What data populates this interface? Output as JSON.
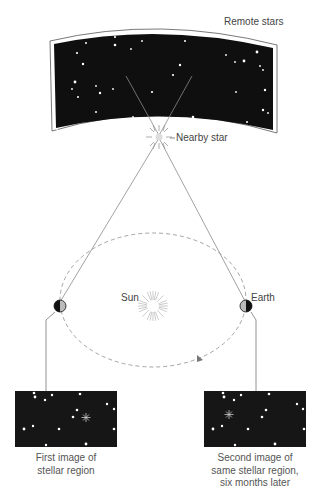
{
  "labels": {
    "remote_stars": "Remote stars",
    "nearby_star": "Nearby star",
    "sun": "Sun",
    "earth": "Earth"
  },
  "captions": {
    "first_image": [
      "First image of",
      "stellar region"
    ],
    "second_image": [
      "Second image of",
      "same stellar region,",
      "six months later"
    ]
  },
  "colors": {
    "sky": "#0f0f0f",
    "star": "#ffffff",
    "line": "#8a8a8a",
    "orbit": "#9a9a9a",
    "sun_rays": "#aaaaaa",
    "text": "#444444"
  }
}
